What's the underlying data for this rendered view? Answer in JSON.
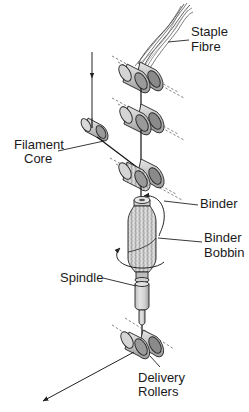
{
  "diagram": {
    "type": "core-spun yarn spinning process schematic",
    "colors": {
      "background": "#ffffff",
      "line": "#222222",
      "roller_fill": "#c8c8c8",
      "roller_end": "#8a8a8a",
      "bobbin_fill": "#d6d6d6"
    },
    "labels": {
      "staple_fibre": [
        "Staple",
        "Fibre"
      ],
      "filament_core": [
        "Filament",
        "Core"
      ],
      "binder": "Binder",
      "binder_bobbin": [
        "Binder",
        "Bobbin"
      ],
      "spindle": "Spindle",
      "delivery_rollers": [
        "Delivery",
        "Rollers"
      ]
    },
    "components": [
      {
        "id": "staple-fibre",
        "label": "Staple Fibre"
      },
      {
        "id": "back-rollers",
        "label": ""
      },
      {
        "id": "middle-rollers",
        "label": ""
      },
      {
        "id": "filament-core-bobbin",
        "label": "Filament Core"
      },
      {
        "id": "front-rollers",
        "label": ""
      },
      {
        "id": "binder",
        "label": "Binder"
      },
      {
        "id": "binder-bobbin",
        "label": "Binder Bobbin"
      },
      {
        "id": "spindle",
        "label": "Spindle"
      },
      {
        "id": "delivery-rollers",
        "label": "Delivery Rollers"
      }
    ],
    "arrows": [
      {
        "id": "filament-feed-arrow",
        "direction": "down"
      },
      {
        "id": "binder-rotation-arrow",
        "direction": "clockwise around bobbin top"
      },
      {
        "id": "spindle-rotation-arrow",
        "direction": "around bobbin base"
      },
      {
        "id": "output-arrow",
        "direction": "down-left"
      }
    ]
  }
}
